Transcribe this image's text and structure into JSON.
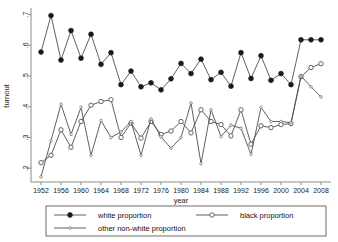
{
  "chart_data": {
    "type": "line",
    "title": "",
    "xlabel": "year",
    "ylabel": "turnout",
    "xlim": [
      1950,
      2010
    ],
    "ylim": [
      0.155,
      0.715
    ],
    "grid": false,
    "legend_position": "bottom",
    "x": [
      1952,
      1954,
      1956,
      1958,
      1960,
      1962,
      1964,
      1966,
      1968,
      1970,
      1972,
      1974,
      1976,
      1978,
      1980,
      1982,
      1984,
      1986,
      1988,
      1990,
      1992,
      1994,
      1996,
      1998,
      2000,
      2002,
      2004,
      2006,
      2008
    ],
    "xtick_labels": [
      "1952",
      "1956",
      "1960",
      "1964",
      "1968",
      "1972",
      "1976",
      "1980",
      "1984",
      "1988",
      "1992",
      "1996",
      "2000",
      "2004",
      "2008"
    ],
    "xticks": [
      1952,
      1956,
      1960,
      1964,
      1968,
      1972,
      1976,
      1980,
      1984,
      1988,
      1992,
      1996,
      2000,
      2004,
      2008
    ],
    "ytick_labels": [
      ".2",
      ".3",
      ".4",
      ".5",
      ".6",
      ".7"
    ],
    "yticks": [
      0.2,
      0.3,
      0.4,
      0.5,
      0.6,
      0.7
    ],
    "series": [
      {
        "name": "white proportion",
        "marker": "filled-circle",
        "values": [
          0.578,
          0.697,
          0.552,
          0.648,
          0.558,
          0.636,
          0.538,
          0.576,
          0.472,
          0.516,
          0.465,
          0.478,
          0.455,
          0.491,
          0.541,
          0.508,
          0.555,
          0.488,
          0.512,
          0.467,
          0.576,
          0.492,
          0.566,
          0.486,
          0.508,
          0.472,
          0.618,
          0.618,
          0.618
        ]
      },
      {
        "name": "black proportion",
        "marker": "open-circle",
        "values": [
          0.218,
          0.242,
          0.325,
          0.268,
          0.352,
          0.405,
          0.417,
          0.423,
          0.3,
          0.347,
          0.298,
          0.352,
          0.31,
          0.321,
          0.352,
          0.315,
          0.39,
          0.352,
          0.342,
          0.305,
          0.39,
          0.278,
          0.338,
          0.332,
          0.342,
          0.345,
          0.498,
          0.528,
          0.54
        ]
      },
      {
        "name": "other non-white proportion",
        "marker": "small-circle",
        "values": [
          0.172,
          0.29,
          0.408,
          0.31,
          0.398,
          0.242,
          0.355,
          0.3,
          0.318,
          0.352,
          0.242,
          0.36,
          0.302,
          0.265,
          0.3,
          0.412,
          0.215,
          0.39,
          0.303,
          0.34,
          0.33,
          0.245,
          0.398,
          0.352,
          0.352,
          0.348,
          0.5,
          0.465,
          0.432
        ]
      }
    ]
  },
  "legend": {
    "entries": [
      {
        "label": "white proportion",
        "marker": "filled-circle"
      },
      {
        "label": "black proportion",
        "marker": "open-circle"
      },
      {
        "label": "other non-white proportion",
        "marker": "small-circle"
      }
    ]
  }
}
